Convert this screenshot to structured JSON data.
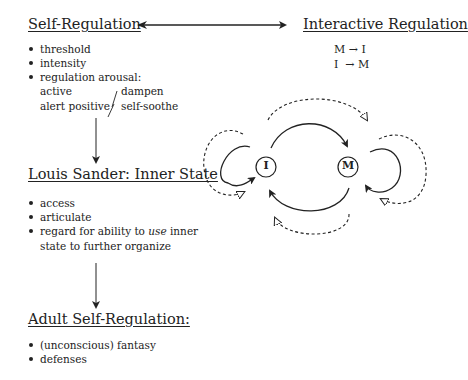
{
  "self_regulation": {
    "title": "Self-Regulation",
    "items": [
      "threshold",
      "intensity",
      "regulation arousal:"
    ],
    "arousal": {
      "left": [
        "active",
        "alert positive"
      ],
      "right": [
        "dampen",
        "self-soothe"
      ]
    }
  },
  "interactive_regulation": {
    "title": "Interactive Regulation",
    "formulas": [
      "M → I",
      "I  → M"
    ]
  },
  "inner_state": {
    "title": "Louis Sander: Inner State",
    "items": [
      "access",
      "articulate"
    ],
    "item3_pre": "regard for ability to ",
    "item3_em": "use",
    "item3_post": " inner",
    "item3_cont": "state to further organize"
  },
  "adult": {
    "title": "Adult Self-Regulation:",
    "items": [
      "(unconscious) fantasy",
      "defenses"
    ]
  },
  "diagram": {
    "node_infant": "I",
    "node_mother": "M"
  }
}
